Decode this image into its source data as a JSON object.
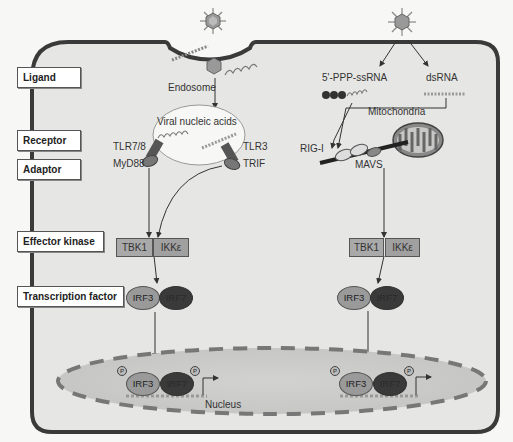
{
  "figure": {
    "left_labels": [
      {
        "id": "ligand",
        "text": "Ligand"
      },
      {
        "id": "receptor",
        "text": "Receptor"
      },
      {
        "id": "adaptor",
        "text": "Adaptor"
      },
      {
        "id": "effector_kinase",
        "text": "Effector kinase"
      },
      {
        "id": "transcription_factor",
        "text": "Transcription factor"
      }
    ],
    "endosome_pathway": {
      "compartment_label": "Endosome",
      "vesicle_label": "Viral nucleic acids",
      "receptor_left": "TLR7/8",
      "adaptor_left": "MyD88",
      "receptor_right": "TLR3",
      "adaptor_right": "TRIF",
      "kinase_1": "TBK1",
      "kinase_2": "IKKε",
      "tf_1": "IRF3",
      "tf_2": "IRF7"
    },
    "cytosolic_pathway": {
      "ligand_1": "5'-PPP-ssRNA",
      "ligand_2": "dsRNA",
      "organelle": "Mitochondria",
      "receptor": "RIG-I",
      "adaptor": "MAVS",
      "kinase_1": "TBK1",
      "kinase_2": "IKKε",
      "tf_1": "IRF3",
      "tf_2": "IRF7"
    },
    "nucleus": {
      "label": "Nucleus",
      "phospho_symbol": "P",
      "left_tf_1": "IRF3",
      "left_tf_2": "IRF7",
      "right_tf_1": "IRF3",
      "right_tf_2": "IRF7"
    },
    "colors": {
      "cell_fill": "#e6e6e4",
      "cell_border": "#3a3a3a",
      "nucleus_fill": "#cfcfcd",
      "nucleus_dash": "#777777",
      "kinase_fill": "#a9a9a9",
      "irf3_fill": "#9a9a9a",
      "irf7_fill": "#3a3a3a"
    }
  }
}
